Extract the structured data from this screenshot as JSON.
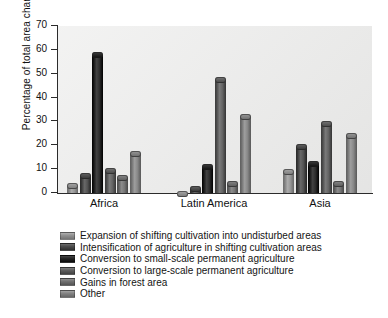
{
  "chart_data": {
    "type": "bar",
    "title": "",
    "xlabel": "",
    "ylabel": "Percentage of total area change",
    "ylim": [
      0,
      70
    ],
    "yticks": [
      0,
      10,
      20,
      30,
      40,
      50,
      60,
      70
    ],
    "grid": false,
    "legend_position": "below",
    "categories": [
      "Africa",
      "Latin America",
      "Asia"
    ],
    "series": [
      {
        "name": "Expansion of shifting cultivation into undisturbed areas",
        "color": "#8e8e8e",
        "values": [
          4,
          1,
          10
        ]
      },
      {
        "name": "Intensification of agriculture in shifting cultivation areas",
        "color": "#4a4a4a",
        "values": [
          8.5,
          3,
          20.5
        ]
      },
      {
        "name": "Conversion to small-scale permanent agriculture",
        "color": "#242424",
        "values": [
          59,
          12,
          13.5
        ]
      },
      {
        "name": "Conversion to large-scale permanent agriculture",
        "color": "#5c5c5c",
        "values": [
          10.5,
          48.5,
          30
        ]
      },
      {
        "name": "Gains in forest area",
        "color": "#6e6e6e",
        "values": [
          7.5,
          5,
          5
        ]
      },
      {
        "name": "Other",
        "color": "#808080",
        "values": [
          17.5,
          33,
          25
        ]
      }
    ]
  },
  "axis": {
    "y_title": "Percentage of total area change",
    "y_tick_labels": [
      "0",
      "10",
      "20",
      "30",
      "40",
      "50",
      "60",
      "70"
    ],
    "x_tick_labels": [
      "Africa",
      "Latin America",
      "Asia"
    ]
  },
  "legend": {
    "items": [
      {
        "label": "Expansion of shifting cultivation into undisturbed areas",
        "color": "#8e8e8e"
      },
      {
        "label": "Intensification of agriculture in shifting cultivation areas",
        "color": "#4a4a4a"
      },
      {
        "label": "Conversion to small-scale permanent agriculture",
        "color": "#242424"
      },
      {
        "label": "Conversion to large-scale permanent agriculture",
        "color": "#5c5c5c"
      },
      {
        "label": "Gains in forest area",
        "color": "#6e6e6e"
      },
      {
        "label": "Other",
        "color": "#808080"
      }
    ]
  }
}
